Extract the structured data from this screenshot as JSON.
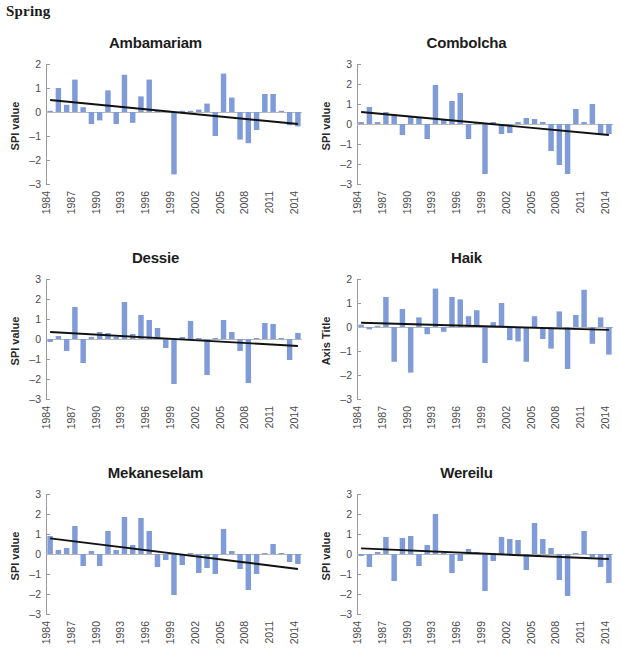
{
  "season": {
    "label": "Spring"
  },
  "style": {
    "bar_color": "#7f9bd8",
    "trend_color": "#111111",
    "axis_color": "#9a9a9a",
    "zero_line_color": "#b8b8b8",
    "text_color": "#231f20",
    "background": "#ffffff"
  },
  "chart_data": [
    {
      "id": "ambamariam",
      "type": "bar",
      "title": "Ambamariam",
      "xlabel": "",
      "ylabel": "SPI value",
      "ylim": [
        -3,
        2
      ],
      "yticks": [
        2,
        1,
        0,
        -1,
        -2,
        -3
      ],
      "xticks": [
        "1984",
        "1987",
        "1990",
        "1993",
        "1996",
        "1999",
        "2002",
        "2005",
        "2008",
        "2011",
        "2014"
      ],
      "x": [
        1984,
        1985,
        1986,
        1987,
        1988,
        1989,
        1990,
        1991,
        1992,
        1993,
        1994,
        1995,
        1996,
        1997,
        1998,
        1999,
        2000,
        2001,
        2002,
        2003,
        2004,
        2005,
        2006,
        2007,
        2008,
        2009,
        2010,
        2011,
        2012,
        2013,
        2014
      ],
      "values": [
        0.05,
        1.0,
        0.3,
        1.35,
        0.2,
        -0.5,
        -0.35,
        0.9,
        -0.5,
        1.55,
        -0.45,
        0.65,
        1.35,
        0.05,
        0.05,
        -2.6,
        0.05,
        0.05,
        0.1,
        0.35,
        -1.0,
        1.6,
        0.6,
        -1.15,
        -1.3,
        -0.75,
        0.75,
        0.75,
        0.05,
        -0.55,
        -0.6
      ],
      "trend": {
        "start": 0.5,
        "end": -0.5
      },
      "grid": false,
      "legend": "none"
    },
    {
      "id": "combolcha",
      "type": "bar",
      "title": "Combolcha",
      "xlabel": "",
      "ylabel": "SPI value",
      "ylim": [
        -3,
        3
      ],
      "yticks": [
        3,
        2,
        1,
        0,
        -1,
        -2,
        -3
      ],
      "xticks": [
        "1984",
        "1987",
        "1990",
        "1993",
        "1996",
        "1999",
        "2002",
        "2005",
        "2008",
        "2011",
        "2014"
      ],
      "x": [
        1984,
        1985,
        1986,
        1987,
        1988,
        1989,
        1990,
        1991,
        1992,
        1993,
        1994,
        1995,
        1996,
        1997,
        1998,
        1999,
        2000,
        2001,
        2002,
        2003,
        2004,
        2005,
        2006,
        2007,
        2008,
        2009,
        2010,
        2011,
        2012,
        2013,
        2014
      ],
      "values": [
        0.1,
        0.85,
        0.1,
        0.6,
        0.45,
        -0.55,
        0.4,
        0.35,
        -0.75,
        1.95,
        0.25,
        1.15,
        1.55,
        -0.75,
        0.1,
        -2.5,
        0.1,
        -0.5,
        -0.45,
        0.1,
        0.3,
        0.25,
        0.1,
        -1.35,
        -2.05,
        -2.5,
        0.75,
        0.1,
        1.0,
        -0.5,
        -0.5
      ],
      "trend": {
        "start": 0.6,
        "end": -0.55
      },
      "grid": false,
      "legend": "none"
    },
    {
      "id": "dessie",
      "type": "bar",
      "title": "Dessie",
      "xlabel": "",
      "ylabel": "SPI value",
      "ylim": [
        -3,
        3
      ],
      "yticks": [
        3,
        2,
        1,
        0,
        -1,
        -2,
        -3
      ],
      "xticks": [
        "1984",
        "1987",
        "1990",
        "1993",
        "1996",
        "1999",
        "2002",
        "2005",
        "2008",
        "2011",
        "2014"
      ],
      "x": [
        1984,
        1985,
        1986,
        1987,
        1988,
        1989,
        1990,
        1991,
        1992,
        1993,
        1994,
        1995,
        1996,
        1997,
        1998,
        1999,
        2000,
        2001,
        2002,
        2003,
        2004,
        2005,
        2006,
        2007,
        2008,
        2009,
        2010,
        2011,
        2012,
        2013,
        2014
      ],
      "values": [
        -0.15,
        0.15,
        -0.6,
        1.6,
        -1.2,
        0.1,
        0.35,
        0.3,
        0.1,
        1.85,
        0.25,
        1.2,
        0.95,
        0.55,
        -0.45,
        -2.25,
        0.1,
        0.9,
        0.05,
        -1.8,
        0.05,
        0.95,
        0.35,
        -0.6,
        -2.2,
        0.05,
        0.8,
        0.75,
        0.05,
        -1.05,
        0.3
      ],
      "trend": {
        "start": 0.35,
        "end": -0.35
      },
      "grid": false,
      "legend": "none"
    },
    {
      "id": "haik",
      "type": "bar",
      "title": "Haik",
      "xlabel": "",
      "ylabel": "Axis Title",
      "ylim": [
        -3,
        2
      ],
      "yticks": [
        2,
        1,
        0,
        -1,
        -2,
        -3
      ],
      "xticks": [
        "1984",
        "1987",
        "1990",
        "1993",
        "1996",
        "1999",
        "2002",
        "2005",
        "2008",
        "2011",
        "2014"
      ],
      "x": [
        1984,
        1985,
        1986,
        1987,
        1988,
        1989,
        1990,
        1991,
        1992,
        1993,
        1994,
        1995,
        1996,
        1997,
        1998,
        1999,
        2000,
        2001,
        2002,
        2003,
        2004,
        2005,
        2006,
        2007,
        2008,
        2009,
        2010,
        2011,
        2012,
        2013,
        2014
      ],
      "values": [
        0.1,
        -0.1,
        0.05,
        1.25,
        -1.45,
        0.75,
        -1.9,
        0.4,
        -0.3,
        1.6,
        -0.2,
        1.25,
        1.15,
        0.45,
        0.7,
        -1.5,
        0.2,
        1.0,
        -0.55,
        -0.6,
        -1.45,
        0.45,
        -0.5,
        -0.9,
        0.65,
        -1.75,
        0.5,
        1.55,
        -0.7,
        0.4,
        -1.15
      ],
      "trend": {
        "start": 0.18,
        "end": -0.12
      },
      "grid": false,
      "legend": "none"
    },
    {
      "id": "mekaneselam",
      "type": "bar",
      "title": "Mekaneselam",
      "xlabel": "",
      "ylabel": "SPI value",
      "ylim": [
        -3,
        3
      ],
      "yticks": [
        3,
        2,
        1,
        0,
        -1,
        -2,
        -3
      ],
      "xticks": [
        "1984",
        "1987",
        "1990",
        "1993",
        "1996",
        "1999",
        "2002",
        "2005",
        "2008",
        "2011",
        "2014"
      ],
      "x": [
        1984,
        1985,
        1986,
        1987,
        1988,
        1989,
        1990,
        1991,
        1992,
        1993,
        1994,
        1995,
        1996,
        1997,
        1998,
        1999,
        2000,
        2001,
        2002,
        2003,
        2004,
        2005,
        2006,
        2007,
        2008,
        2009,
        2010,
        2011,
        2012,
        2013,
        2014
      ],
      "values": [
        0.9,
        0.2,
        0.3,
        1.4,
        -0.6,
        0.15,
        -0.6,
        1.15,
        0.2,
        1.85,
        0.45,
        1.8,
        1.15,
        -0.65,
        -0.3,
        -2.05,
        -0.55,
        0.05,
        -0.95,
        -0.7,
        -1.0,
        1.25,
        0.15,
        -0.75,
        -1.8,
        -1.0,
        0.05,
        0.5,
        0.05,
        -0.4,
        -0.5
      ],
      "trend": {
        "start": 0.78,
        "end": -0.75
      },
      "grid": false,
      "legend": "none"
    },
    {
      "id": "wereilu",
      "type": "bar",
      "title": "Wereilu",
      "xlabel": "",
      "ylabel": "SPI value",
      "ylim": [
        -3,
        3
      ],
      "yticks": [
        3,
        2,
        1,
        0,
        -1,
        -2,
        -3
      ],
      "xticks": [
        "1984",
        "1987",
        "1990",
        "1993",
        "1996",
        "1999",
        "2002",
        "2005",
        "2008",
        "2011",
        "2014"
      ],
      "x": [
        1984,
        1985,
        1986,
        1987,
        1988,
        1989,
        1990,
        1991,
        1992,
        1993,
        1994,
        1995,
        1996,
        1997,
        1998,
        1999,
        2000,
        2001,
        2002,
        2003,
        2004,
        2005,
        2006,
        2007,
        2008,
        2009,
        2010,
        2011,
        2012,
        2013,
        2014
      ],
      "values": [
        -0.1,
        -0.65,
        0.1,
        0.85,
        -1.35,
        0.8,
        0.9,
        -0.6,
        0.45,
        2.0,
        0.05,
        -0.95,
        -0.35,
        0.25,
        0.1,
        -1.85,
        -0.35,
        0.85,
        0.75,
        0.7,
        -0.8,
        1.55,
        0.75,
        0.3,
        -1.3,
        -2.1,
        0.05,
        1.15,
        -0.15,
        -0.65,
        -1.45
      ],
      "trend": {
        "start": 0.28,
        "end": -0.25
      },
      "grid": false,
      "legend": "none"
    }
  ]
}
